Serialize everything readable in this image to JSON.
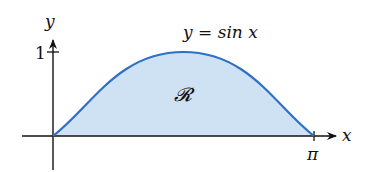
{
  "diagram": {
    "curve_label": "y = sin x",
    "region_label": "𝓡",
    "x_axis_label": "x",
    "y_axis_label": "y",
    "y_tick_label": "1",
    "x_tick_label": "π",
    "colors": {
      "curve": "#2f6fc4",
      "region_fill": "#cfe2f3",
      "axis": "#111111"
    }
  }
}
